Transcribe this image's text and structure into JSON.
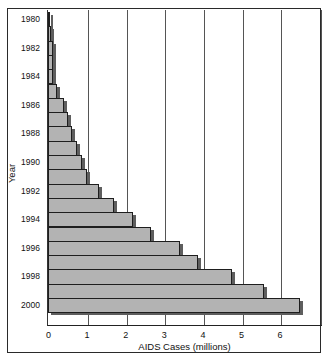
{
  "chart_data": {
    "type": "bar",
    "orientation": "horizontal",
    "title": "",
    "xlabel": "AIDS Cases (millions)",
    "ylabel": "Year",
    "xlim": [
      0,
      7
    ],
    "x_ticks": [
      "0",
      "1",
      "2",
      "3",
      "4",
      "5",
      "6"
    ],
    "y_tick_labels": [
      "1980",
      "1982",
      "1984",
      "1986",
      "1988",
      "1990",
      "1992",
      "1994",
      "1996",
      "1998",
      "2000"
    ],
    "grid": "vertical lines at each integer",
    "categories": [
      "1980",
      "1981",
      "1982",
      "1983",
      "1984",
      "1985",
      "1986",
      "1987",
      "1988",
      "1989",
      "1990",
      "1991",
      "1992",
      "1993",
      "1994",
      "1995",
      "1996",
      "1997",
      "1998",
      "1999",
      "2000"
    ],
    "values": [
      0.02,
      0.03,
      0.09,
      0.09,
      0.09,
      0.19,
      0.38,
      0.49,
      0.59,
      0.71,
      0.84,
      0.97,
      1.29,
      1.68,
      2.16,
      2.64,
      3.39,
      3.86,
      4.73,
      5.56,
      6.48
    ],
    "colors": {
      "bar": "#b3b3b3",
      "bar_border": "#1e1e1e",
      "shadow": "#5e5e5e",
      "grid": "#555555"
    }
  }
}
